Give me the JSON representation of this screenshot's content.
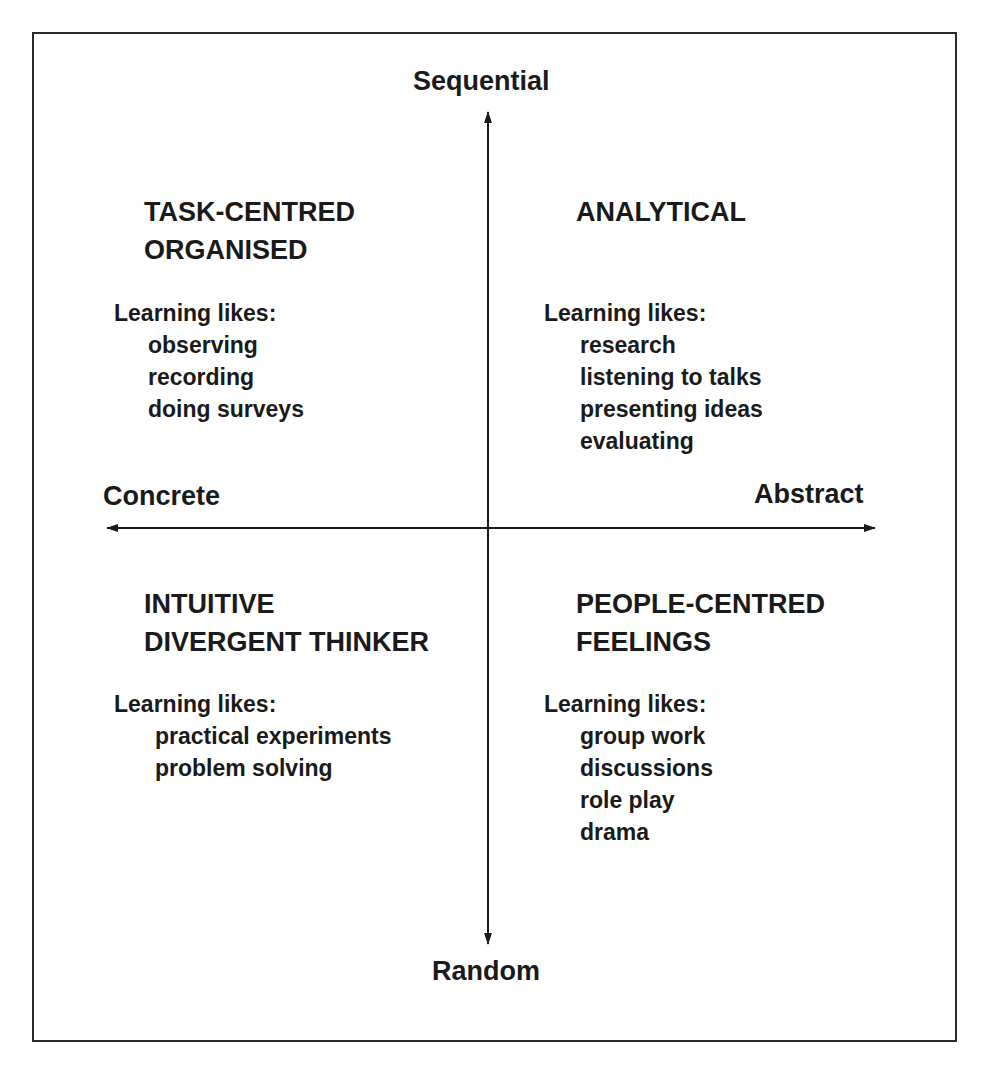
{
  "axes": {
    "top": "Sequential",
    "bottom": "Random",
    "left": "Concrete",
    "right": "Abstract"
  },
  "quadrants": [
    {
      "position": "top-left",
      "title": [
        "TASK-CENTRED",
        "ORGANISED"
      ],
      "likes_label": "Learning likes:",
      "likes": [
        "observing",
        "recording",
        "doing surveys"
      ]
    },
    {
      "position": "top-right",
      "title": [
        "ANALYTICAL"
      ],
      "likes_label": "Learning likes:",
      "likes": [
        "research",
        "listening to talks",
        "presenting ideas",
        "evaluating"
      ]
    },
    {
      "position": "bottom-left",
      "title": [
        "INTUITIVE",
        "DIVERGENT THINKER"
      ],
      "likes_label": "Learning likes:",
      "likes": [
        "practical experiments",
        "problem solving"
      ]
    },
    {
      "position": "bottom-right",
      "title": [
        "PEOPLE-CENTRED",
        "FEELINGS"
      ],
      "likes_label": "Learning likes:",
      "likes": [
        "group work",
        "discussions",
        "role play",
        "drama"
      ]
    }
  ],
  "colors": {
    "ink": "#1a1a1a",
    "background": "#ffffff"
  }
}
